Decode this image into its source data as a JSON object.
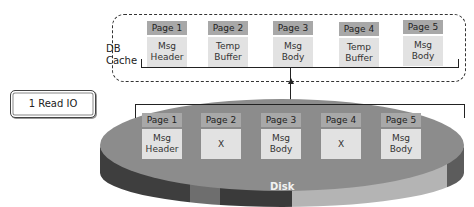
{
  "cache": {
    "label_line1": "DB",
    "label_line2": "Cache",
    "pages": [
      {
        "title": "Page 1",
        "content": "Msg\nHeader"
      },
      {
        "title": "Page 2",
        "content": "Temp\nBuffer"
      },
      {
        "title": "Page 3",
        "content": "Msg\nBody"
      },
      {
        "title": "Page 4",
        "content": "Temp\nBuffer"
      },
      {
        "title": "Page 5",
        "content": "Msg\nBody"
      }
    ]
  },
  "io_box": {
    "label": "1 Read IO"
  },
  "disk": {
    "label": "Disk",
    "pages": [
      {
        "title": "Page 1",
        "content": "Msg\nHeader"
      },
      {
        "title": "Page 2",
        "content": "X"
      },
      {
        "title": "Page 3",
        "content": "Msg\nBody"
      },
      {
        "title": "Page 4",
        "content": "X"
      },
      {
        "title": "Page 5",
        "content": "Msg\nBody"
      }
    ]
  },
  "colors": {
    "page_header": "#a8a8a8",
    "page_body": "#e2e2e2",
    "disk_top": "#8c8c8c",
    "disk_side_dark": "#3e3e3e",
    "disk_side_mid": "#707070",
    "disk_side_light": "#b4b4b4"
  }
}
